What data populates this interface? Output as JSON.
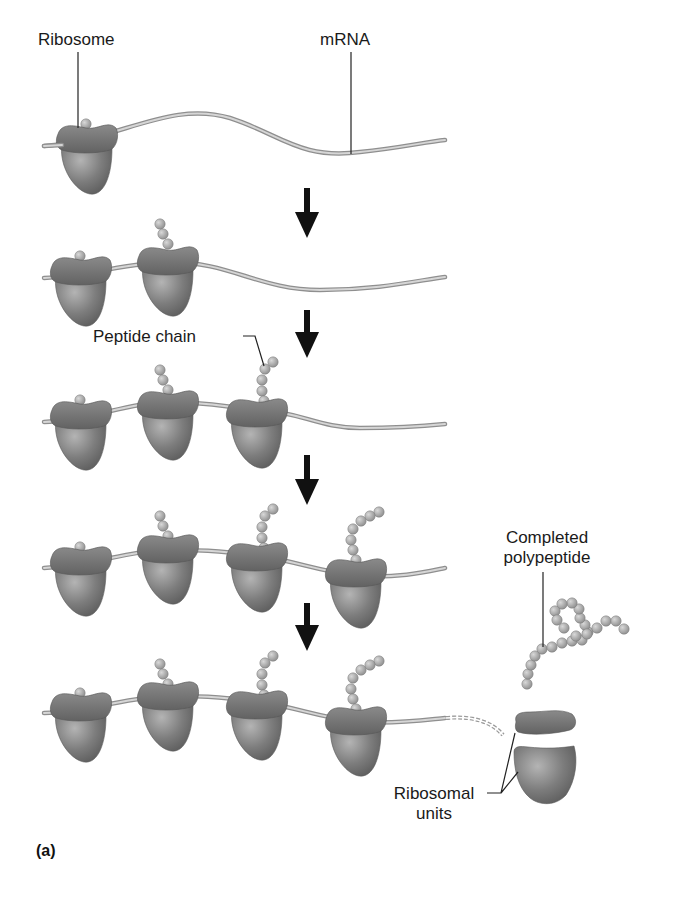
{
  "figure": {
    "panel_label": "(a)",
    "labels": {
      "ribosome": "Ribosome",
      "mrna": "mRNA",
      "peptide_chain": "Peptide chain",
      "completed_polypeptide_line1": "Completed",
      "completed_polypeptide_line2": "polypeptide",
      "ribosomal_units_line1": "Ribosomal",
      "ribosomal_units_line2": "units"
    },
    "stages": [
      {
        "step": 1,
        "ribosomes_on_mrna": 1,
        "peptide_lengths": [
          1
        ]
      },
      {
        "step": 2,
        "ribosomes_on_mrna": 2,
        "peptide_lengths": [
          1,
          3
        ]
      },
      {
        "step": 3,
        "ribosomes_on_mrna": 3,
        "peptide_lengths": [
          1,
          3,
          5
        ]
      },
      {
        "step": 4,
        "ribosomes_on_mrna": 4,
        "peptide_lengths": [
          1,
          3,
          5,
          8
        ]
      },
      {
        "step": 5,
        "ribosomes_on_mrna": 4,
        "peptide_lengths": [
          1,
          3,
          5,
          8
        ],
        "released": "completed polypeptide + ribosomal subunits"
      }
    ],
    "colors": {
      "ribosome_large": "#7a7a7a",
      "ribosome_small": "#6c6c6c",
      "amino_acid": "#a8a8a8",
      "mrna": "#bdbdbd",
      "arrow": "#111111",
      "leader_line": "#222222"
    }
  }
}
